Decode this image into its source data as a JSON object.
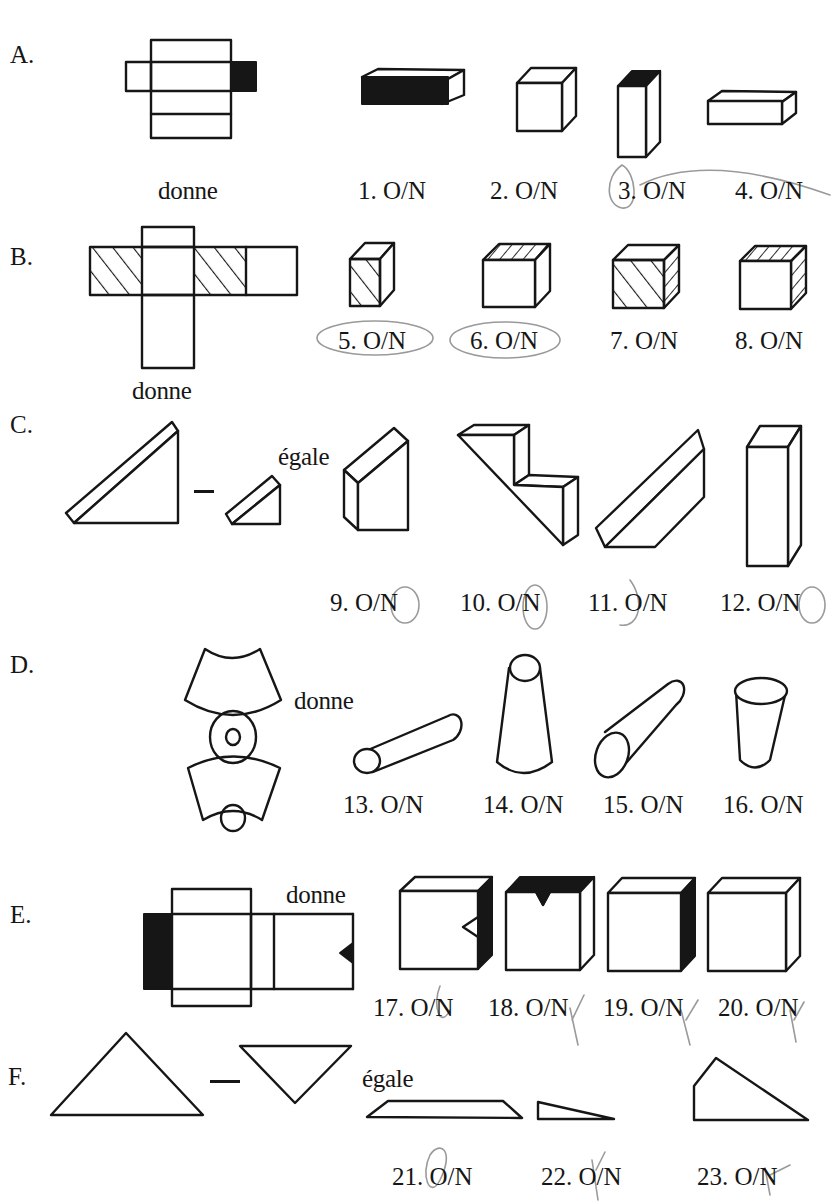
{
  "worksheet": {
    "sections": [
      {
        "label": "A.",
        "operator_word": "donne",
        "items": [
          {
            "number": "1.",
            "choice": "O/N"
          },
          {
            "number": "2.",
            "choice": "O/N"
          },
          {
            "number": "3.",
            "choice": "O/N",
            "circled_by_hand": true
          },
          {
            "number": "4.",
            "choice": "O/N",
            "circled_by_hand": true
          }
        ]
      },
      {
        "label": "B.",
        "operator_word": "donne",
        "items": [
          {
            "number": "5.",
            "choice": "O/N",
            "circled_by_hand": true
          },
          {
            "number": "6.",
            "choice": "O/N",
            "circled_by_hand": true
          },
          {
            "number": "7.",
            "choice": "O/N"
          },
          {
            "number": "8.",
            "choice": "O/N"
          }
        ]
      },
      {
        "label": "C.",
        "operator_symbol": "–",
        "operator_word": "égale",
        "items": [
          {
            "number": "9.",
            "choice": "O/N",
            "marked": "N"
          },
          {
            "number": "10.",
            "choice": "O/N",
            "marked": "N"
          },
          {
            "number": "11.",
            "choice": "O/N",
            "marked": "O"
          },
          {
            "number": "12.",
            "choice": "O/N",
            "marked": "N"
          }
        ]
      },
      {
        "label": "D.",
        "operator_word": "donne",
        "items": [
          {
            "number": "13.",
            "choice": "O/N"
          },
          {
            "number": "14.",
            "choice": "O/N"
          },
          {
            "number": "15.",
            "choice": "O/N"
          },
          {
            "number": "16.",
            "choice": "O/N"
          }
        ]
      },
      {
        "label": "E.",
        "operator_word": "donne",
        "items": [
          {
            "number": "17.",
            "choice": "O/N",
            "marked": "O"
          },
          {
            "number": "18.",
            "choice": "O/N",
            "marked": "N"
          },
          {
            "number": "19.",
            "choice": "O/N",
            "marked": "N"
          },
          {
            "number": "20.",
            "choice": "O/N",
            "marked": "N"
          }
        ]
      },
      {
        "label": "F.",
        "operator_symbol": "–",
        "operator_word": "égale",
        "items": [
          {
            "number": "21.",
            "choice": "O/N",
            "marked": "O"
          },
          {
            "number": "22.",
            "choice": "O/N",
            "marked": "N"
          },
          {
            "number": "23.",
            "choice": "O/N",
            "marked": "N"
          }
        ]
      }
    ]
  },
  "colors": {
    "ink": "#161616",
    "pencil": "#9a9a9a",
    "paper": "#ffffff"
  }
}
